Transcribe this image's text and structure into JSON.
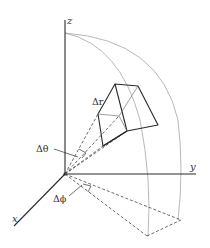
{
  "figure": {
    "type": "spherical coordinate volume element",
    "axes": {
      "x_label": "x",
      "y_label": "y",
      "z_label": "z"
    },
    "labels": {
      "delta_r": "Δr",
      "delta_theta": "Δθ",
      "delta_phi": "Δϕ"
    },
    "colors": {
      "axis": "#2a2a2a",
      "arc": "#9a9a9a",
      "dashed": "#444444",
      "background": "#ffffff"
    }
  }
}
